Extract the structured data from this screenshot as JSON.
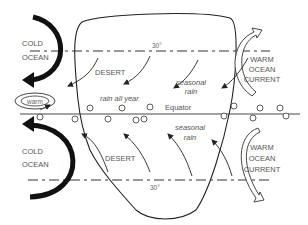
{
  "diagram": {
    "labels": {
      "cold_ocean_top": [
        "COLD",
        "OCEAN"
      ],
      "cold_ocean_bottom": [
        "COLD",
        "OCEAN"
      ],
      "warm_current_top": [
        "WARM",
        "OCEAN",
        "CURRENT"
      ],
      "warm_current_bottom": [
        "WARM",
        "OCEAN",
        "CURRENT"
      ],
      "desert_north": "DESERT",
      "desert_south": "DESERT",
      "rain_all_year": "rain all year",
      "seasonal_rain_north": [
        "seasonal",
        "rain"
      ],
      "seasonal_rain_south": [
        "seasonal",
        "rain"
      ],
      "equator": "Equator",
      "lat_north": "30°",
      "lat_south": "30°",
      "warm_eddy": "warm"
    },
    "colors": {
      "line": "#222222",
      "text": "#555555",
      "background": "#ffffff"
    }
  }
}
